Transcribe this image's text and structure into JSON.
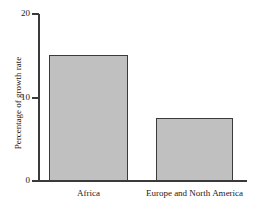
{
  "chart_data": {
    "type": "bar",
    "title": "",
    "xlabel": "",
    "ylabel": "Percentage of growth rate",
    "categories": [
      "Africa",
      "Europe and North America"
    ],
    "values": [
      15.1,
      7.5
    ],
    "ylim": [
      0,
      20
    ],
    "yticks": [
      0,
      10,
      20
    ],
    "ytick_labels": [
      "0",
      "10",
      "20"
    ],
    "grid": false,
    "legend": false,
    "bar_fill_color": "#c0c0c0",
    "bar_edge_color": "#3a3a3a",
    "axis_color": "#3a3a3a",
    "background_color": "#ffffff"
  },
  "figure": {
    "clipped_title": "",
    "ylabel": "Percentage of growth rate",
    "ytick_0": "0",
    "ytick_10": "10",
    "ytick_20": "20",
    "category_0": "Africa",
    "category_1": "Europe and North America"
  }
}
